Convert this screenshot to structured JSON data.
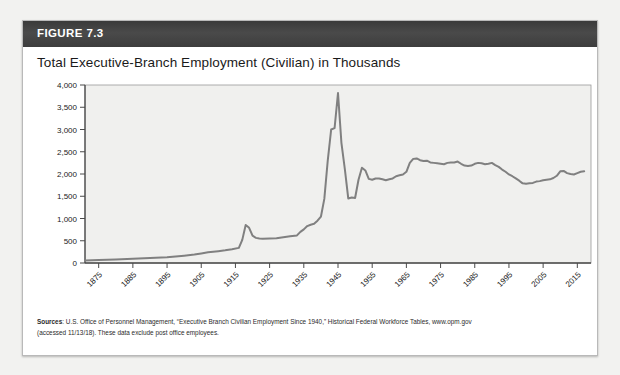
{
  "figure": {
    "label": "FIGURE 7.3",
    "title": "Total Executive-Branch Employment (Civilian) in Thousands"
  },
  "source": {
    "prefix": "Sources",
    "line1": ": U.S. Office of Personnel Management, “Executive Branch Civilian Employment Since 1940,” Historical Federal Workforce Tables, www.opm.gov",
    "line2": "(accessed 11/13/18). These data exclude post office employees."
  },
  "colors": {
    "header_bar": "#3f3f3f",
    "plot_background": "#f0f0ee",
    "line": "#808080",
    "axis": "#4a4a4a",
    "card_border": "#b9b9b9",
    "title_text": "#1a1a1a"
  },
  "chart_data": {
    "type": "line",
    "title": "Total Executive-Branch Employment (Civilian) in Thousands",
    "xlabel": "",
    "ylabel": "",
    "xlim": [
      1871,
      2019
    ],
    "ylim": [
      0,
      4000
    ],
    "grid": false,
    "legend": null,
    "ytick_labels": [
      "0",
      "500",
      "1,000",
      "1,500",
      "2,000",
      "2,500",
      "3,000",
      "3,500",
      "4,000"
    ],
    "ytick_values": [
      0,
      500,
      1000,
      1500,
      2000,
      2500,
      3000,
      3500,
      4000
    ],
    "xtick_labels": [
      "1875",
      "1885",
      "1895",
      "1905",
      "1915",
      "1925",
      "1935",
      "1945",
      "1955",
      "1965",
      "1975",
      "1985",
      "1995",
      "2005",
      "2015"
    ],
    "xtick_values": [
      1875,
      1885,
      1895,
      1905,
      1915,
      1925,
      1935,
      1945,
      1955,
      1965,
      1975,
      1985,
      1995,
      2005,
      2015
    ],
    "series": [
      {
        "name": "Total executive-branch civilian employment",
        "x": [
          1871,
          1875,
          1880,
          1885,
          1890,
          1895,
          1900,
          1903,
          1905,
          1907,
          1910,
          1912,
          1914,
          1916,
          1917,
          1918,
          1919,
          1920,
          1921,
          1922,
          1923,
          1925,
          1927,
          1929,
          1931,
          1933,
          1934,
          1935,
          1936,
          1937,
          1938,
          1939,
          1940,
          1941,
          1942,
          1943,
          1944,
          1945,
          1946,
          1947,
          1948,
          1949,
          1950,
          1951,
          1952,
          1953,
          1954,
          1955,
          1956,
          1957,
          1958,
          1959,
          1960,
          1961,
          1962,
          1963,
          1964,
          1965,
          1966,
          1967,
          1968,
          1969,
          1970,
          1971,
          1972,
          1973,
          1974,
          1975,
          1976,
          1977,
          1978,
          1979,
          1980,
          1981,
          1982,
          1983,
          1984,
          1985,
          1986,
          1987,
          1988,
          1989,
          1990,
          1991,
          1992,
          1993,
          1994,
          1995,
          1996,
          1997,
          1998,
          1999,
          2000,
          2001,
          2002,
          2003,
          2004,
          2005,
          2006,
          2007,
          2008,
          2009,
          2010,
          2011,
          2012,
          2013,
          2014,
          2015,
          2016,
          2017
        ],
        "y": [
          55,
          65,
          80,
          95,
          110,
          130,
          165,
          190,
          215,
          240,
          265,
          285,
          310,
          340,
          520,
          855,
          790,
          615,
          565,
          550,
          545,
          550,
          555,
          580,
          600,
          620,
          700,
          755,
          830,
          860,
          880,
          950,
          1040,
          1440,
          2300,
          3000,
          3030,
          3820,
          2700,
          2110,
          1450,
          1470,
          1460,
          1870,
          2140,
          2080,
          1890,
          1870,
          1900,
          1900,
          1880,
          1860,
          1880,
          1900,
          1950,
          1970,
          1990,
          2050,
          2250,
          2340,
          2350,
          2310,
          2290,
          2300,
          2260,
          2250,
          2240,
          2230,
          2220,
          2250,
          2260,
          2260,
          2280,
          2230,
          2190,
          2180,
          2190,
          2230,
          2250,
          2240,
          2220,
          2230,
          2250,
          2200,
          2160,
          2100,
          2050,
          1990,
          1950,
          1900,
          1850,
          1790,
          1780,
          1790,
          1800,
          1830,
          1840,
          1860,
          1870,
          1880,
          1910,
          1960,
          2060,
          2070,
          2020,
          2000,
          1990,
          2020,
          2050,
          2060
        ]
      }
    ]
  }
}
